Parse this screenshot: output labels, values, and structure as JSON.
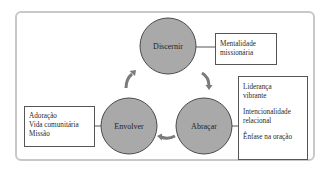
{
  "diagram": {
    "colors": {
      "circle_fill": "#a9a9a9",
      "circle_stroke": "#4a4a4a",
      "arrow": "#7a7a7a",
      "frame": "#c8c8c8",
      "box_border": "#555555"
    },
    "nodes": [
      {
        "id": "discernir",
        "label": "Discernir"
      },
      {
        "id": "abracar",
        "label": "Abraçar"
      },
      {
        "id": "envolver",
        "label": "Envolver"
      }
    ],
    "cycle_order": [
      "Discernir",
      "Abraçar",
      "Envolver"
    ],
    "boxes": {
      "discernir": {
        "lines": [
          "Mentalidade",
          "missionária"
        ]
      },
      "abracar": {
        "groups": [
          [
            "Liderança",
            "vibrante"
          ],
          [
            "Intencionalidade",
            "relacional"
          ],
          [
            "Ênfase na oração"
          ]
        ]
      },
      "envolver": {
        "lines": [
          "Adoração",
          "Vida comunitária",
          "Missão"
        ]
      }
    }
  }
}
